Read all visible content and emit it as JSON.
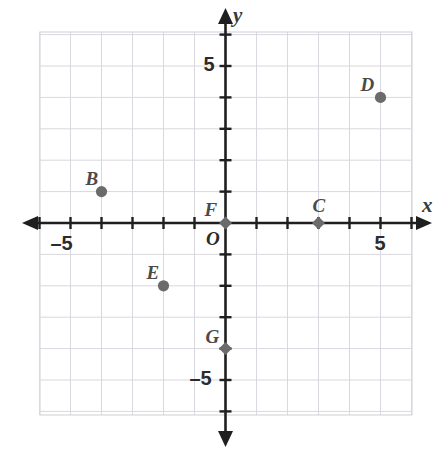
{
  "chart_data": {
    "type": "scatter",
    "title": "",
    "xlabel": "x",
    "ylabel": "y",
    "grid": true,
    "legend": "none",
    "xlim": [
      -6,
      6
    ],
    "ylim": [
      -6,
      6
    ],
    "x_tick_labels": [
      {
        "value": -5,
        "text": "–5"
      },
      {
        "value": 5,
        "text": "5"
      }
    ],
    "y_tick_labels": [
      {
        "value": 5,
        "text": "5"
      },
      {
        "value": -5,
        "text": "–5"
      }
    ],
    "origin_label": "O",
    "tick_interval": 1,
    "point_color": "#6b6b6b",
    "grid_color": "#d8d8de",
    "axis_color": "#1f1f1f",
    "points": [
      {
        "label": "B",
        "x": -4,
        "y": 1,
        "marker": "circle",
        "label_dx": -16,
        "label_dy": -24
      },
      {
        "label": "C",
        "x": 3,
        "y": 0,
        "marker": "diamond",
        "label_dx": -6,
        "label_dy": -28
      },
      {
        "label": "D",
        "x": 5,
        "y": 4,
        "marker": "circle",
        "label_dx": -20,
        "label_dy": -23
      },
      {
        "label": "E",
        "x": -2,
        "y": -2,
        "marker": "circle",
        "label_dx": -17,
        "label_dy": -24
      },
      {
        "label": "F",
        "x": 0,
        "y": 0,
        "marker": "diamond",
        "label_dx": -21,
        "label_dy": -24
      },
      {
        "label": "G",
        "x": 0,
        "y": -4,
        "marker": "diamond",
        "label_dx": -20,
        "label_dy": -23
      }
    ]
  },
  "axes": {
    "x_axis_label": "x",
    "y_axis_label": "y"
  }
}
